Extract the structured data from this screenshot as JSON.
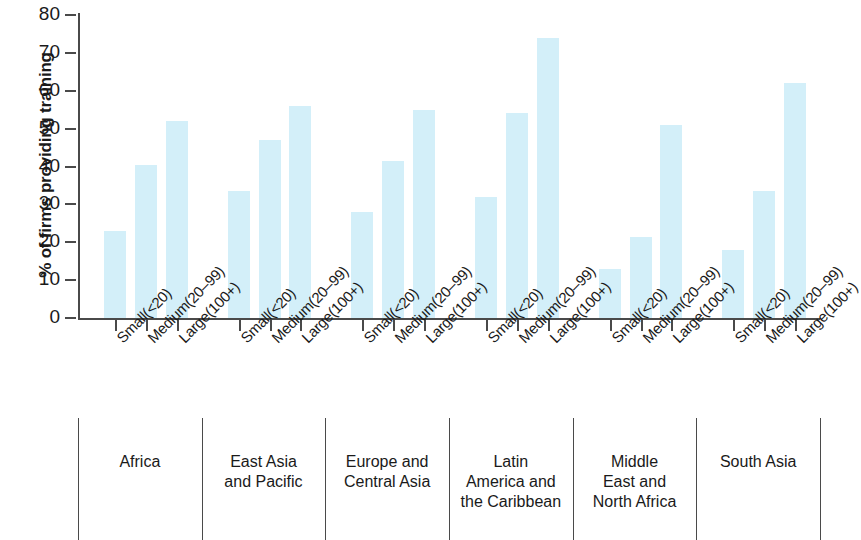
{
  "chart_data": {
    "type": "bar",
    "title": "",
    "xlabel": "",
    "ylabel": "% of firms providing training",
    "ylim": [
      0,
      80
    ],
    "yticks": [
      0,
      10,
      20,
      30,
      40,
      50,
      60,
      70,
      80
    ],
    "grid": false,
    "legend": "none",
    "categories": [
      "Small(<20)",
      "Medium(20–99)",
      "Large(100+)",
      "Small(<20)",
      "Medium(20–99)",
      "Large(100+)",
      "Small(<20)",
      "Medium(20–99)",
      "Large(100+)",
      "Small(<20)",
      "Medium(20–99)",
      "Large(100+)",
      "Small(<20)",
      "Medium(20–99)",
      "Large(100+)",
      "Small(<20)",
      "Medium(20–99)",
      "Large(100+)"
    ],
    "values": [
      23,
      40.5,
      52,
      33.5,
      47,
      56,
      28,
      41.5,
      55,
      32,
      54,
      74,
      13,
      21.5,
      51,
      18,
      33.5,
      62
    ],
    "groups": [
      {
        "label": "Africa",
        "lines": [
          "Africa"
        ],
        "sizes": [
          "Small(<20)",
          "Medium(20–99)",
          "Large(100+)"
        ],
        "values": [
          23,
          40.5,
          52
        ]
      },
      {
        "label": "East Asia and Pacific",
        "lines": [
          "East Asia",
          "and Pacific"
        ],
        "sizes": [
          "Small(<20)",
          "Medium(20–99)",
          "Large(100+)"
        ],
        "values": [
          33.5,
          47,
          56
        ]
      },
      {
        "label": "Europe and Central Asia",
        "lines": [
          "Europe and",
          "Central Asia"
        ],
        "sizes": [
          "Small(<20)",
          "Medium(20–99)",
          "Large(100+)"
        ],
        "values": [
          28,
          41.5,
          55
        ]
      },
      {
        "label": "Latin America and the Caribbean",
        "lines": [
          "Latin",
          "America and",
          "the Caribbean"
        ],
        "sizes": [
          "Small(<20)",
          "Medium(20–99)",
          "Large(100+)"
        ],
        "values": [
          32,
          54,
          74
        ]
      },
      {
        "label": "Middle East and North Africa",
        "lines": [
          "Middle",
          "East and",
          "North Africa"
        ],
        "sizes": [
          "Small(<20)",
          "Medium(20–99)",
          "Large(100+)"
        ],
        "values": [
          13,
          21.5,
          51
        ]
      },
      {
        "label": "South Asia",
        "lines": [
          "South Asia"
        ],
        "sizes": [
          "Small(<20)",
          "Medium(20–99)",
          "Large(100+)"
        ],
        "values": [
          18,
          33.5,
          62
        ]
      }
    ],
    "bar_color": "#d3eff9",
    "axis_color": "#4a4a4a"
  }
}
